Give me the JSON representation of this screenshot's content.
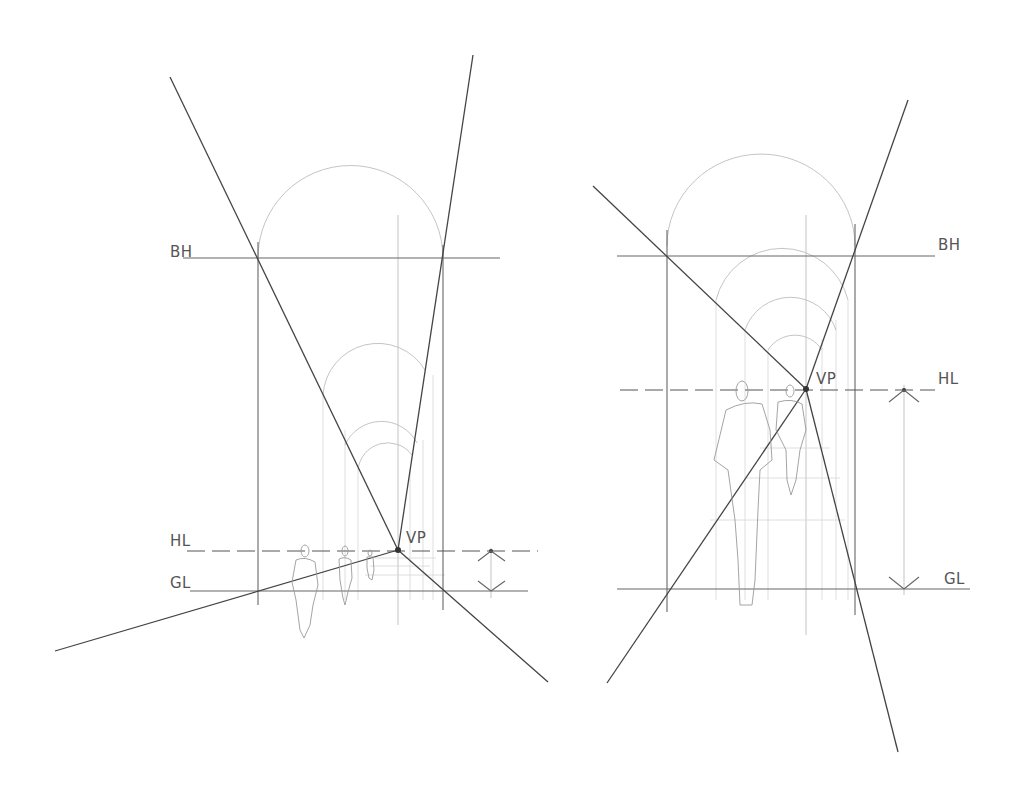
{
  "diagrams": [
    {
      "id": "left",
      "labels": {
        "bh": {
          "text": "BH",
          "x": 170,
          "y": 257
        },
        "hl": {
          "text": "HL",
          "x": 170,
          "y": 546
        },
        "gl": {
          "text": "GL",
          "x": 170,
          "y": 588
        },
        "vp": {
          "text": "VP",
          "x": 406,
          "y": 543
        }
      },
      "vanishing_point": {
        "x": 398,
        "y": 550
      },
      "building_height_y": 258,
      "horizon_y": 551,
      "ground_y": 591,
      "walls_x": [
        258,
        443
      ],
      "center_x": 398,
      "eye_level_marker_x": 491
    },
    {
      "id": "right",
      "labels": {
        "bh": {
          "text": "BH",
          "x": 938,
          "y": 250
        },
        "hl": {
          "text": "HL",
          "x": 938,
          "y": 384
        },
        "gl": {
          "text": "GL",
          "x": 944,
          "y": 584
        },
        "vp": {
          "text": "VP",
          "x": 816,
          "y": 384
        }
      },
      "vanishing_point": {
        "x": 806,
        "y": 389
      },
      "building_height_y": 256,
      "horizon_y": 390,
      "ground_y": 589,
      "walls_x": [
        667,
        855
      ],
      "center_x": 806,
      "eye_level_marker_x": 904
    }
  ]
}
